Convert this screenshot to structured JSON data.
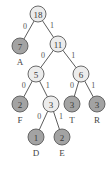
{
  "colors": {
    "internal_fill": "#ececec",
    "leaf_fill": "#a3a3a3",
    "outline": "#5a5a5a"
  },
  "nodes": [
    {
      "id": "n18",
      "weight": "18",
      "kind": "internal",
      "symbol": ""
    },
    {
      "id": "n7",
      "weight": "7",
      "kind": "leaf",
      "symbol": "A"
    },
    {
      "id": "n11",
      "weight": "11",
      "kind": "internal",
      "symbol": ""
    },
    {
      "id": "n5",
      "weight": "5",
      "kind": "internal",
      "symbol": ""
    },
    {
      "id": "n6",
      "weight": "6",
      "kind": "internal",
      "symbol": ""
    },
    {
      "id": "nF",
      "weight": "2",
      "kind": "leaf",
      "symbol": "F"
    },
    {
      "id": "n3",
      "weight": "3",
      "kind": "internal",
      "symbol": ""
    },
    {
      "id": "nT",
      "weight": "3",
      "kind": "leaf",
      "symbol": "T"
    },
    {
      "id": "nR",
      "weight": "3",
      "kind": "leaf",
      "symbol": "R"
    },
    {
      "id": "nD",
      "weight": "1",
      "kind": "leaf",
      "symbol": "D"
    },
    {
      "id": "nE",
      "weight": "2",
      "kind": "leaf",
      "symbol": "E"
    }
  ],
  "edges": [
    {
      "from": "n18",
      "to": "n7",
      "bit": "0"
    },
    {
      "from": "n18",
      "to": "n11",
      "bit": "1"
    },
    {
      "from": "n11",
      "to": "n5",
      "bit": "0"
    },
    {
      "from": "n11",
      "to": "n6",
      "bit": "1"
    },
    {
      "from": "n5",
      "to": "nF",
      "bit": "0"
    },
    {
      "from": "n5",
      "to": "n3",
      "bit": "1"
    },
    {
      "from": "n6",
      "to": "nT",
      "bit": "0"
    },
    {
      "from": "n6",
      "to": "nR",
      "bit": "1"
    },
    {
      "from": "n3",
      "to": "nD",
      "bit": "0"
    },
    {
      "from": "n3",
      "to": "nE",
      "bit": "1"
    }
  ]
}
